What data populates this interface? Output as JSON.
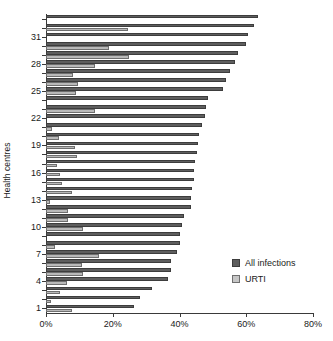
{
  "chart_data": {
    "type": "bar",
    "orientation": "horizontal",
    "title": "",
    "xlabel": "",
    "ylabel": "Health centres",
    "xlim": [
      0,
      80
    ],
    "xunit": "%",
    "xticks": [
      0,
      20,
      40,
      60,
      80
    ],
    "xticklabels": [
      "0%",
      "20%",
      "40%",
      "60%",
      "80%"
    ],
    "yticks": [
      1,
      4,
      7,
      10,
      13,
      16,
      19,
      22,
      25,
      28,
      31
    ],
    "yticklabels": [
      "1",
      "4",
      "7",
      "10",
      "13",
      "16",
      "19",
      "22",
      "25",
      "28",
      "31"
    ],
    "grid": false,
    "legend_position": "lower right",
    "categories": [
      1,
      2,
      3,
      4,
      5,
      6,
      7,
      8,
      9,
      10,
      11,
      12,
      13,
      14,
      15,
      16,
      17,
      18,
      19,
      20,
      21,
      22,
      23,
      24,
      25,
      26,
      27,
      28,
      29,
      30,
      31,
      32,
      33
    ],
    "series": [
      {
        "name": "All infections",
        "color": "#5e5e5e",
        "values": [
          26.5,
          28.3,
          31.8,
          36.6,
          37.6,
          37.6,
          39.4,
          40.0,
          40.0,
          40.6,
          41.4,
          43.3,
          43.4,
          43.6,
          44.2,
          44.4,
          44.6,
          45.2,
          45.4,
          45.7,
          46.7,
          47.5,
          47.9,
          48.5,
          53.1,
          53.9,
          55.2,
          56.7,
          57.5,
          60.0,
          60.6,
          62.2,
          63.4
        ]
      },
      {
        "name": "URTI",
        "color": "#b9b9b9",
        "values": [
          7.9,
          1.6,
          4.2,
          6.2,
          11.2,
          10.7,
          15.9,
          2.8,
          0.0,
          11.0,
          6.7,
          6.5,
          1.1,
          7.9,
          4.9,
          4.2,
          3.4,
          9.4,
          8.6,
          3.8,
          1.9,
          0.0,
          14.8,
          0.0,
          9.1,
          9.5,
          8.0,
          14.8,
          24.8,
          18.8,
          0.0,
          24.6,
          0.0
        ]
      }
    ]
  },
  "legend": {
    "items": [
      {
        "label": "All infections",
        "key": "all"
      },
      {
        "label": "URTI",
        "key": "urti"
      }
    ]
  }
}
